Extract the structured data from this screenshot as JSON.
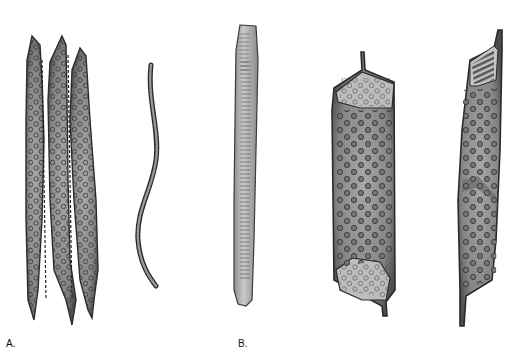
{
  "figure": {
    "panels": [
      {
        "label": "A.",
        "elements": [
          "tracheid-cluster",
          "fiber"
        ]
      },
      {
        "label": "B.",
        "elements": [
          "vessel-element-narrow",
          "vessel-element-wide",
          "vessel-element-oblique"
        ]
      }
    ],
    "colors": {
      "cell_fill": "#8a8a8a",
      "cell_outline": "#2a2a2a",
      "pit": "#4a4a4a",
      "end_wall": "#bdbdbd",
      "narrow_vessel_fill": "#b9b9b9",
      "background": "#ffffff"
    }
  }
}
